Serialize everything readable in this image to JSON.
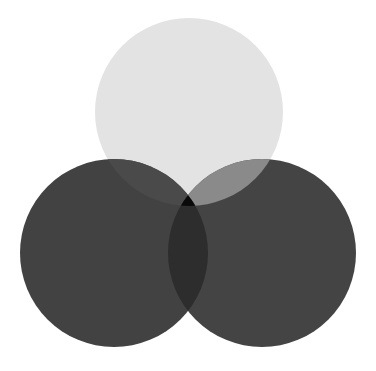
{
  "canvas": {
    "width": 376,
    "height": 371,
    "background": "#ffffff",
    "title": "Three-circle Venn diagram"
  },
  "chart_data": {
    "type": "venn",
    "title": "",
    "subtitle": "",
    "xlabel": "",
    "ylabel": "",
    "grid": false,
    "legend_position": "none",
    "annotations": [],
    "set_count": 3,
    "sets": [
      {
        "id": "top",
        "label": "",
        "cx": 189,
        "cy": 112,
        "r": 94,
        "fill": "#e3e3e3",
        "opacity": 1
      },
      {
        "id": "left",
        "label": "",
        "cx": 114,
        "cy": 253,
        "r": 94,
        "fill": "#424242",
        "opacity": 1
      },
      {
        "id": "right",
        "label": "",
        "cx": 262,
        "cy": 253,
        "r": 94,
        "fill": "#444444",
        "opacity": 1
      }
    ],
    "regions": [
      {
        "id": "top-only",
        "members": [
          "top"
        ],
        "fill": "#e3e3e3"
      },
      {
        "id": "left-only",
        "members": [
          "left"
        ],
        "fill": "#424242"
      },
      {
        "id": "right-only",
        "members": [
          "right"
        ],
        "fill": "#444444"
      },
      {
        "id": "top-left",
        "members": [
          "top",
          "left"
        ],
        "fill": "#4a4a4a"
      },
      {
        "id": "top-right",
        "members": [
          "top",
          "right"
        ],
        "fill": "#8a8a8a"
      },
      {
        "id": "left-right",
        "members": [
          "left",
          "right"
        ],
        "fill": "#2d2d2d"
      },
      {
        "id": "top-left-right",
        "members": [
          "top",
          "left",
          "right"
        ],
        "fill": "#0a0a0a"
      }
    ]
  }
}
